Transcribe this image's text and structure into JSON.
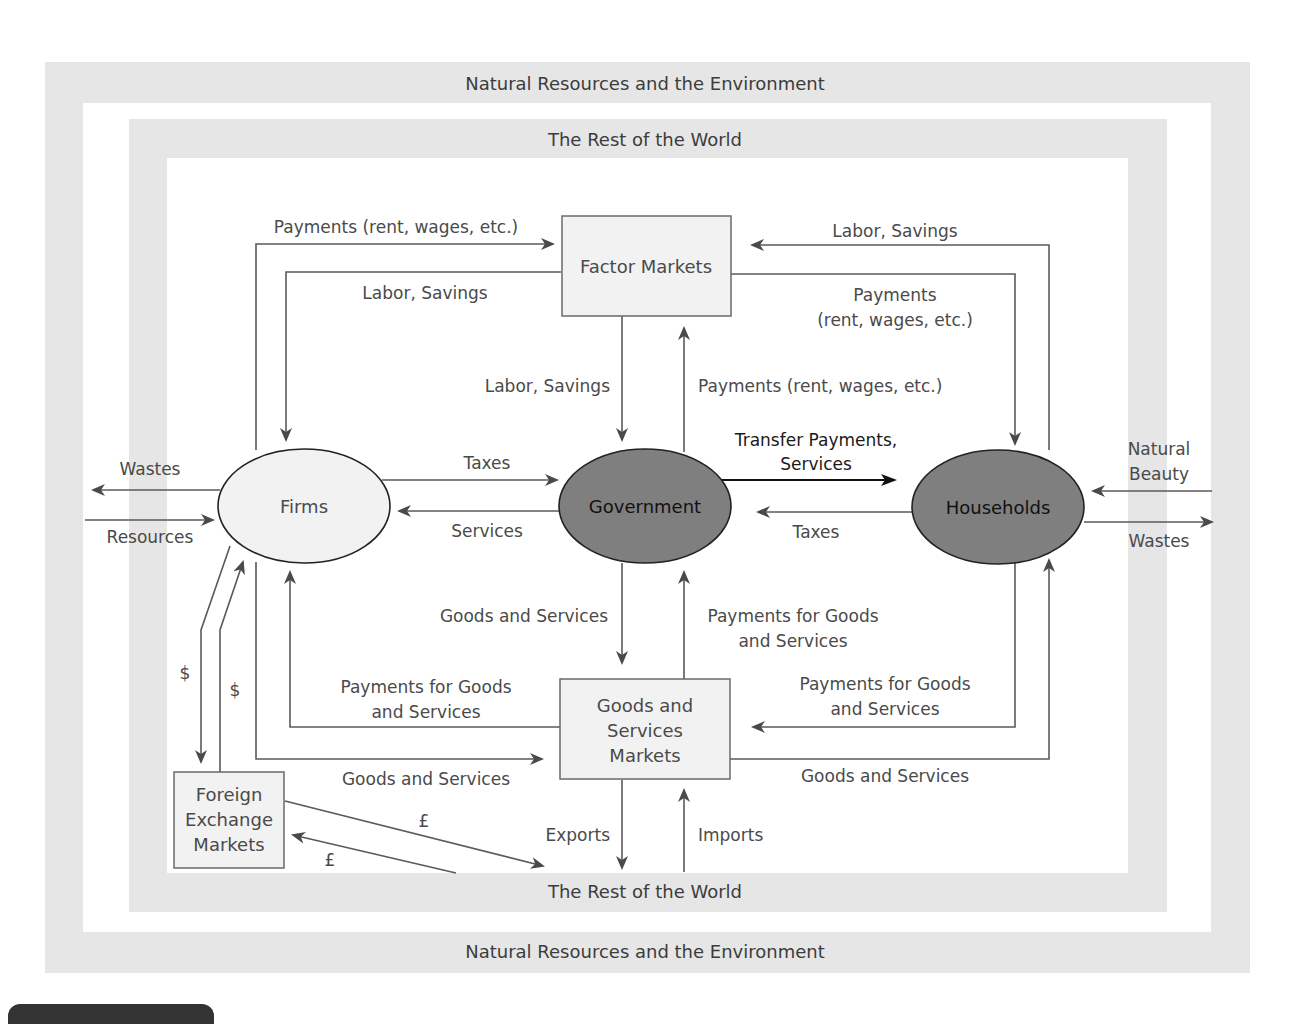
{
  "colors": {
    "band": "#e6e6e6",
    "box_fill": "#f2f2f2",
    "firms_fill": "#f2f2f2",
    "government_fill": "#7a7a7a",
    "households_fill": "#7a7a7a",
    "line": "#5a5a5a",
    "text": "#4a4a4a"
  },
  "bands": {
    "outer_top": "Natural Resources and the Environment",
    "outer_bottom": "Natural Resources and the Environment",
    "inner_top": "The Rest of the World",
    "inner_bottom": "The Rest of the World"
  },
  "nodes": {
    "factor_markets": "Factor Markets",
    "firms": "Firms",
    "government": "Government",
    "households": "Households",
    "goods_markets": [
      "Goods and",
      "Services",
      "Markets"
    ],
    "foreign_exchange": [
      "Foreign",
      "Exchange",
      "Markets"
    ]
  },
  "flows": {
    "firms_to_factor_payments": "Payments (rent, wages, etc.)",
    "factor_to_firms_labor": "Labor, Savings",
    "households_to_factor_labor": "Labor, Savings",
    "factor_to_households_payments": [
      "Payments",
      "(rent, wages, etc.)"
    ],
    "factor_to_government_labor": "Labor, Savings",
    "government_to_factor_payments": "Payments (rent, wages, etc.)",
    "government_to_households_transfer": [
      "Transfer Payments,",
      "Services"
    ],
    "households_to_government_taxes": "Taxes",
    "firms_to_government_taxes": "Taxes",
    "government_to_firms_services": "Services",
    "firms_wastes": "Wastes",
    "firms_resources": "Resources",
    "households_natural_beauty": [
      "Natural",
      "Beauty"
    ],
    "households_wastes": "Wastes",
    "government_to_goods": "Goods and Services",
    "goods_to_government_payments": [
      "Payments for Goods",
      "and Services"
    ],
    "goods_to_firms_payments": [
      "Payments for Goods",
      "and Services"
    ],
    "firms_to_goods": "Goods and Services",
    "households_to_goods_payments": [
      "Payments for Goods",
      "and Services"
    ],
    "goods_to_households": "Goods and Services",
    "exports": "Exports",
    "imports": "Imports",
    "dollar_down": "$",
    "dollar_up": "$",
    "pound_out": "£",
    "pound_in": "£"
  }
}
